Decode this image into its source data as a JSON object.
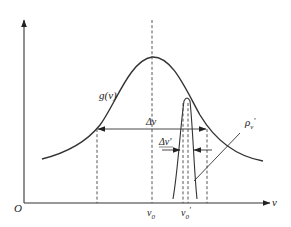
{
  "figure": {
    "origin_label": "O",
    "x_axis_label": "v",
    "broad_curve_label": "g(v)",
    "broad_width_label": "Δv",
    "narrow_width_label": "Δv'",
    "narrow_curve_label": "ρ",
    "narrow_curve_label_sub": "v",
    "narrow_curve_label_prime": "'",
    "tick_v0": "v",
    "tick_v0_sub": "0",
    "tick_v0p": "v",
    "tick_v0p_sub": "0",
    "tick_v0p_prime": "'",
    "colors": {
      "ink": "#333333"
    }
  }
}
